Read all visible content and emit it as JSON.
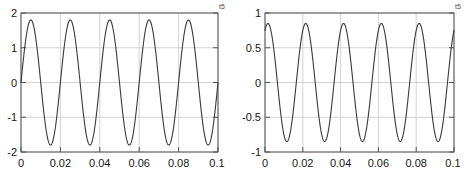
{
  "figure": {
    "title": "",
    "background_color": "#ffffff",
    "panel_count": 2
  },
  "chart_data": [
    {
      "type": "line",
      "title": "",
      "xlabel": "",
      "ylabel": "",
      "xlim": [
        0,
        0.1
      ],
      "ylim": [
        -2,
        2
      ],
      "xticks": [
        0,
        0.02,
        0.04,
        0.06,
        0.08,
        0.1
      ],
      "xticklabels": [
        "0",
        "0.02",
        "0.04",
        "0.06",
        "0.08",
        "0.1"
      ],
      "yticks": [
        -2,
        -1,
        0,
        1,
        2
      ],
      "yticklabels": [
        "-2",
        "-1",
        "0",
        "1",
        "2"
      ],
      "grid": true,
      "legend": null,
      "line_color": "#3a3a3a",
      "grid_color": "#c8c8c8",
      "axis_color": "#555555",
      "series": [
        {
          "name": "signal-left",
          "waveform": "sine",
          "amplitude": 1.8,
          "frequency_hz": 50,
          "phase_rad": 0,
          "offset": 0,
          "cycles_shown": 5,
          "peak_value": 1.8,
          "trough_value": -1.82,
          "start_value": 0,
          "end_value": -1.2
        }
      ],
      "corner_mark": "t5"
    },
    {
      "type": "line",
      "title": "",
      "xlabel": "",
      "ylabel": "",
      "xlim": [
        0,
        0.1
      ],
      "ylim": [
        -1,
        1
      ],
      "xticks": [
        0,
        0.02,
        0.04,
        0.06,
        0.08,
        0.1
      ],
      "xticklabels": [
        "0",
        "0.02",
        "0.04",
        "0.06",
        "0.08",
        "0.1"
      ],
      "yticks": [
        -1,
        -0.5,
        0,
        0.5,
        1
      ],
      "yticklabels": [
        "-1",
        "-0.5",
        "0",
        "0.5",
        "1"
      ],
      "grid": true,
      "legend": null,
      "line_color": "#3a3a3a",
      "grid_color": "#c8c8c8",
      "axis_color": "#555555",
      "series": [
        {
          "name": "signal-right",
          "waveform": "sine",
          "amplitude": 0.85,
          "frequency_hz": 50,
          "phase_rad": 1.08,
          "offset": 0,
          "cycles_shown": 5,
          "peak_value": 0.85,
          "trough_value": -0.86,
          "start_value": 0.75,
          "end_value": 0.45
        }
      ],
      "corner_mark": "t5"
    }
  ],
  "panels": [
    {
      "name": "left-plot",
      "xticklabels": [
        "0",
        "0.02",
        "0.04",
        "0.06",
        "0.08",
        "0.1"
      ],
      "yticklabels": [
        "2",
        "1",
        "0",
        "-1",
        "-2"
      ],
      "corner_mark": "t5"
    },
    {
      "name": "right-plot",
      "xticklabels": [
        "0",
        "0.02",
        "0.04",
        "0.06",
        "0.08",
        "0.1"
      ],
      "yticklabels": [
        "1",
        "0.5",
        "0",
        "-0.5",
        "-1"
      ],
      "corner_mark": "t5"
    }
  ]
}
